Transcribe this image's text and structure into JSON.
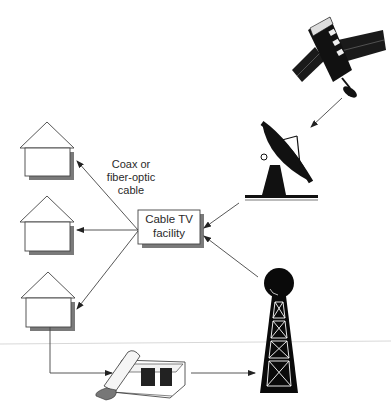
{
  "diagram": {
    "nodes": {
      "satellite": {
        "name": "Satellite"
      },
      "dish": {
        "name": "Satellite dish"
      },
      "tower": {
        "name": "Broadcast tower"
      },
      "facility": {
        "label": "Cable TV facility"
      },
      "phone": {
        "name": "Telephone"
      },
      "houses": [
        {
          "name": "House 1"
        },
        {
          "name": "House 2"
        },
        {
          "name": "House 3"
        }
      ]
    },
    "edge_label": {
      "line1": "Coax or",
      "line2": "fiber-optic",
      "line3": "cable"
    },
    "facility_label": {
      "line1": "Cable TV",
      "line2": "facility"
    },
    "edges": [
      {
        "from": "satellite",
        "to": "dish"
      },
      {
        "from": "dish",
        "to": "facility"
      },
      {
        "from": "tower",
        "to": "facility"
      },
      {
        "from": "facility",
        "to": "House 1"
      },
      {
        "from": "facility",
        "to": "House 2"
      },
      {
        "from": "facility",
        "to": "House 3"
      },
      {
        "from": "House 3",
        "to": "phone"
      },
      {
        "from": "phone",
        "to": "tower"
      }
    ],
    "colors": {
      "line": "#444444",
      "ink": "#111111",
      "shadow": "#7a7a7a"
    }
  }
}
